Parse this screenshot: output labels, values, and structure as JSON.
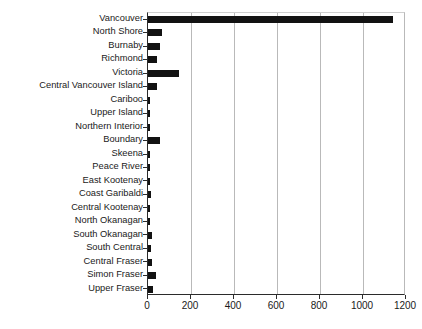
{
  "chart_data": {
    "type": "bar",
    "orientation": "horizontal",
    "title": "",
    "xlabel": "",
    "ylabel": "",
    "xlim": [
      0,
      1200
    ],
    "xticks": [
      0,
      200,
      400,
      600,
      800,
      1000,
      1200
    ],
    "xtick_labels": [
      "0",
      "200",
      "400",
      "600",
      "800",
      "1000",
      "1200"
    ],
    "grid": "vertical",
    "legend": "none",
    "bar_color": "#121212",
    "categories": [
      "Vancouver",
      "North Shore",
      "Burnaby",
      "Richmond",
      "Victoria",
      "Central Vancouver Island",
      "Cariboo",
      "Upper Island",
      "Northern Interior",
      "Boundary",
      "Skeena",
      "Peace River",
      "East Kootenay",
      "Coast Garibaldi",
      "Central Kootenay",
      "North Okanagan",
      "South Okanagan",
      "South Central",
      "Central Fraser",
      "Simon Fraser",
      "Upper Fraser"
    ],
    "values": [
      1140,
      65,
      58,
      42,
      144,
      40,
      10,
      10,
      8,
      55,
      8,
      8,
      8,
      16,
      10,
      8,
      20,
      15,
      20,
      36,
      22
    ]
  }
}
